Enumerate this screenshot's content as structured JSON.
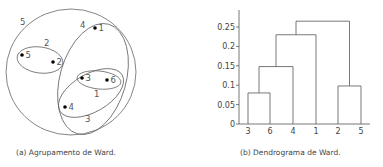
{
  "figure_a": {
    "caption": "(a) Agrupamento de Ward.",
    "points": [
      {
        "id": "1",
        "x": 95,
        "y": 28
      },
      {
        "id": "2",
        "x": 53,
        "y": 62
      },
      {
        "id": "3",
        "x": 82,
        "y": 78
      },
      {
        "id": "4",
        "x": 65,
        "y": 107
      },
      {
        "id": "5",
        "x": 22,
        "y": 55
      },
      {
        "id": "6",
        "x": 107,
        "y": 80
      }
    ],
    "clusters": [
      {
        "label": "1",
        "members": [
          "3",
          "6"
        ]
      },
      {
        "label": "2",
        "members": [
          "2",
          "5"
        ]
      },
      {
        "label": "3",
        "members": [
          "3",
          "6",
          "4"
        ]
      },
      {
        "label": "4",
        "members": [
          "3",
          "6",
          "4",
          "1"
        ]
      },
      {
        "label": "5",
        "members": [
          "1",
          "2",
          "3",
          "4",
          "5",
          "6"
        ]
      }
    ]
  },
  "figure_b": {
    "caption": "(b) Dendrograma de Ward."
  },
  "chart_data": {
    "type": "dendrogram",
    "title": "",
    "xlabel": "",
    "ylabel": "",
    "ylim": [
      0,
      0.28
    ],
    "yticks": [
      0,
      0.05,
      0.1,
      0.15,
      0.2,
      0.25
    ],
    "ytick_labels": [
      "0",
      "0.05",
      "0.1",
      "0.15",
      "0.2",
      "0.25"
    ],
    "leaf_order": [
      "3",
      "6",
      "4",
      "1",
      "2",
      "5"
    ],
    "merges": [
      {
        "left": "3",
        "right": "6",
        "height": 0.08
      },
      {
        "left": "(3,6)",
        "right": "4",
        "height": 0.148
      },
      {
        "left": "2",
        "right": "5",
        "height": 0.098
      },
      {
        "left": "((3,6),4)",
        "right": "1",
        "height": 0.23
      },
      {
        "left": "(((3,6),4),1)",
        "right": "(2,5)",
        "height": 0.265
      }
    ],
    "grid": false
  },
  "colors": {
    "line": "#555555",
    "text": "#444444",
    "point": "#000000"
  }
}
